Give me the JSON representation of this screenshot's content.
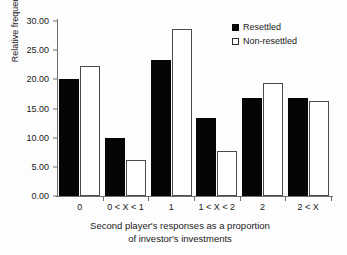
{
  "chart_data": {
    "type": "bar",
    "title": "",
    "xlabel": "Second player's responses as a proportion of investor's investments",
    "ylabel": "Relative frequency",
    "categories": [
      "0",
      "0 < X < 1",
      "1",
      "1 < X < 2",
      "2",
      "2 < X"
    ],
    "series": [
      {
        "name": "Resettled",
        "values": [
          20.0,
          9.9,
          23.4,
          13.3,
          16.8,
          16.8
        ],
        "color": "#050505"
      },
      {
        "name": "Non-resettled",
        "values": [
          22.3,
          6.2,
          28.6,
          7.8,
          19.3,
          16.3
        ],
        "color": "#ffffff"
      }
    ],
    "ylim": [
      0,
      30
    ],
    "ytick_values": [
      0,
      5,
      10,
      15,
      20,
      25,
      30
    ],
    "ytick_labels": [
      "0.00",
      "5.00",
      "10.00",
      "15.00",
      "20.00",
      "25.00",
      "30.00"
    ],
    "grid": false,
    "legend_position": "top-right"
  },
  "axes": {
    "y_title": "Relative frequency",
    "x_title_line1": "Second player's responses as a proportion",
    "x_title_line2": "of investor's investments"
  },
  "legend": {
    "items": [
      {
        "label": "Resettled",
        "swatch": "filled-square"
      },
      {
        "label": "Non-resettled",
        "swatch": "hollow-square"
      }
    ]
  }
}
